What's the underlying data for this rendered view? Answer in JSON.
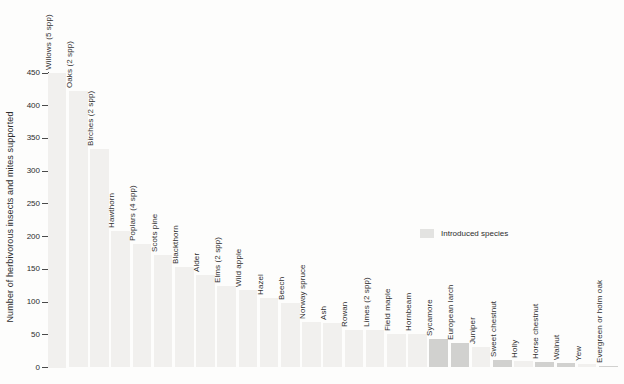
{
  "figure": {
    "y_axis_label": "Number of herbivorous insects and mites supported",
    "legend_label": "Introduced species"
  },
  "chart_data": {
    "type": "bar",
    "title": "",
    "xlabel": "",
    "ylabel": "Number of herbivorous insects and mites supported",
    "ylim": [
      0,
      450
    ],
    "yticks": [
      0,
      50,
      100,
      150,
      200,
      250,
      300,
      350,
      400,
      450
    ],
    "grid": false,
    "legend": {
      "label": "Introduced species",
      "position": "middle-right"
    },
    "categories": [
      "Willows (5 spp)",
      "Oaks (2 spp)",
      "Birches (2 spp)",
      "Hawthorn",
      "Poplars (4 spp)",
      "Scots pine",
      "Blackthorn",
      "Alder",
      "Elms (2 spp)",
      "Wild apple",
      "Hazel",
      "Beech",
      "Norway spruce",
      "Ash",
      "Rowan",
      "Limes (2 spp)",
      "Field maple",
      "Hornbeam",
      "Sycamore",
      "European larch",
      "Juniper",
      "Sweet chestnut",
      "Holly",
      "Horse chestnut",
      "Walnut",
      "Yew",
      "Evergreen or holm oak"
    ],
    "values": [
      450,
      423,
      334,
      209,
      189,
      172,
      153,
      141,
      124,
      118,
      106,
      98,
      70,
      68,
      58,
      57,
      51,
      51,
      43,
      38,
      32,
      11,
      10,
      9,
      7,
      6,
      2
    ],
    "introduced_flags": [
      false,
      false,
      false,
      false,
      false,
      false,
      false,
      false,
      false,
      false,
      false,
      false,
      false,
      false,
      false,
      false,
      false,
      false,
      true,
      true,
      false,
      true,
      false,
      true,
      true,
      false,
      true
    ],
    "colors": {
      "native_bar": "#f1f0ee",
      "introduced_bar": "#d1d1cf",
      "legend_swatch": "#e3e3e1",
      "axis": "#4a4a4a",
      "text": "#2c2c2c"
    }
  }
}
